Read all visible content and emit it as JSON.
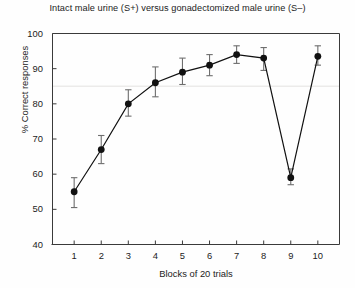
{
  "chart_data": {
    "type": "line",
    "title": "Intact male urine (S+) versus gonadectomized male urine (S–)",
    "xlabel": "Blocks of 20 trials",
    "ylabel": "% Correct responses",
    "x": [
      1,
      2,
      3,
      4,
      5,
      6,
      7,
      8,
      9,
      10
    ],
    "xtick_labels": [
      "1",
      "2",
      "3",
      "4",
      "5",
      "6",
      "7",
      "8",
      "9",
      "10"
    ],
    "ytick_labels": [
      "100",
      "90",
      "80",
      "70",
      "60",
      "50",
      "40"
    ],
    "yticks": [
      100,
      90,
      80,
      70,
      60,
      50,
      40
    ],
    "values": [
      55,
      67,
      80,
      86,
      89,
      91,
      94,
      93,
      59,
      93.5
    ],
    "error_lower": [
      4.5,
      4.0,
      3.5,
      4.0,
      3.5,
      3.0,
      2.5,
      3.5,
      2.0,
      2.5
    ],
    "error_upper": [
      4.0,
      4.0,
      4.0,
      4.5,
      4.0,
      3.0,
      2.5,
      3.0,
      2.5,
      3.0
    ],
    "xlim": [
      0.2,
      10.8
    ],
    "ylim": [
      40,
      100
    ],
    "grid": false,
    "legend": "none",
    "marker": "filled-circle",
    "series_color": "#111111",
    "reference_line": {
      "y": 85,
      "color": "#ecebea",
      "style": "solid"
    }
  }
}
